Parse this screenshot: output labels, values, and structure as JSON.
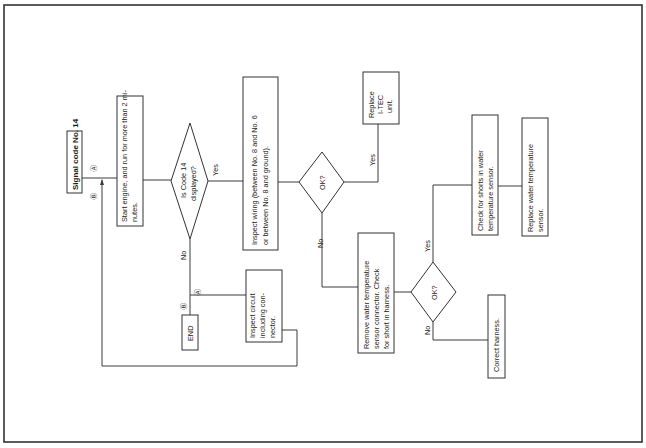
{
  "document": {
    "orientation": "rotated-90-ccw",
    "title": "Signal code No. 14",
    "colors": {
      "line": "#3a3a3a",
      "background": "#ffffff",
      "text": "#1a1a1a"
    }
  },
  "flowchart": {
    "nodes": {
      "start": {
        "lines": [
          "Start engine, and run for more than 2 mi-",
          "nutes."
        ]
      },
      "decision_code14": {
        "lines": [
          "Is Code 14",
          "displayed?"
        ]
      },
      "inspect_wiring": {
        "lines": [
          "Inspect wiring (between No. 8 and No. 6",
          "or between No. 8 and ground)."
        ]
      },
      "decision_ok1": {
        "lines": [
          "OK?"
        ]
      },
      "replace_itec": {
        "lines": [
          "Replace",
          "I-TEC",
          "unit."
        ]
      },
      "remove_sensor": {
        "lines": [
          "Remove water temperature",
          "sensor connector.  Check",
          "for short in harness."
        ]
      },
      "decision_ok2": {
        "lines": [
          "OK?"
        ]
      },
      "check_shorts": {
        "lines": [
          "Check for shorts in water",
          "temperature sensor."
        ]
      },
      "replace_sensor": {
        "lines": [
          "Replace water temperature",
          "sensor."
        ]
      },
      "correct_harness": {
        "lines": [
          "Correct harness."
        ]
      },
      "end": {
        "lines": [
          "END"
        ]
      },
      "inspect_circuit": {
        "lines": [
          "Inspect circuit",
          "including con-",
          "nector."
        ]
      }
    },
    "labels": {
      "yes": "Yes",
      "no": "No",
      "marker_a": "Ⓐ",
      "marker_b": "Ⓑ"
    }
  }
}
